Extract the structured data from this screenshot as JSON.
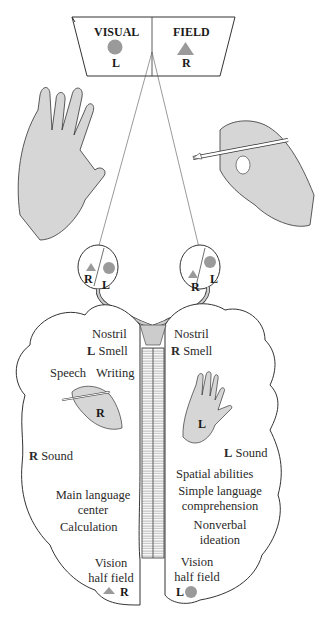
{
  "visual_field": {
    "left_label": "VISUAL",
    "right_label": "FIELD",
    "left_side": "L",
    "right_side": "R",
    "left_shape": "circle",
    "right_shape": "triangle"
  },
  "eyes": {
    "left_eye": {
      "left_letter": "R",
      "right_letter": "L"
    },
    "right_eye": {
      "left_letter": "R",
      "right_letter": "L"
    }
  },
  "left_hemisphere": {
    "nostril": "Nostril",
    "smell_side": "L",
    "smell": "Smell",
    "speech": "Speech",
    "writing": "Writing",
    "hand_letter": "R",
    "sound_side": "R",
    "sound": "Sound",
    "language_1": "Main language",
    "language_2": "center",
    "calculation": "Calculation",
    "vision_1": "Vision",
    "vision_2": "half field",
    "vision_side": "R"
  },
  "right_hemisphere": {
    "nostril": "Nostril",
    "smell_side": "R",
    "smell": "Smell",
    "hand_letter": "L",
    "sound_side": "L",
    "sound": "Sound",
    "spatial": "Spatial abilities",
    "simple_1": "Simple language",
    "simple_2": "comprehension",
    "nonverbal_1": "Nonverbal",
    "nonverbal_2": "ideation",
    "vision_1": "Vision",
    "vision_2": "half field",
    "vision_side": "L"
  },
  "colors": {
    "shape_gray": "#9a9a9a",
    "skin_gray": "#d6d6d6",
    "line": "#333333"
  }
}
